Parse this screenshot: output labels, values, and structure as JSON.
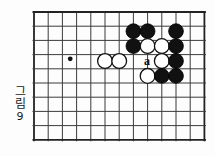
{
  "figure": {
    "caption_text": "그림",
    "caption_number": "9",
    "type": "go-board-diagram"
  },
  "board": {
    "origin_x": 34,
    "origin_y": 12,
    "cell": 14.2,
    "cols": 12,
    "rows": 9,
    "line_color": "#3b3b3b",
    "edge_color": "#222222",
    "line_width": 1.0,
    "edge_width": 1.8,
    "background": "#ffffff"
  },
  "star_points": [
    {
      "name": "star-point-1",
      "col": 2.55,
      "row": 3.3
    }
  ],
  "stones": [
    {
      "name": "stone-black-1",
      "color": "black",
      "col": 7.0,
      "row": 1.35,
      "label": ""
    },
    {
      "name": "stone-black-2",
      "color": "black",
      "col": 8.0,
      "row": 1.35,
      "label": ""
    },
    {
      "name": "stone-black-3",
      "color": "black",
      "col": 10.0,
      "row": 1.35,
      "label": ""
    },
    {
      "name": "stone-black-4",
      "color": "black",
      "col": 7.0,
      "row": 2.4,
      "label": ""
    },
    {
      "name": "stone-white-1",
      "color": "white",
      "col": 8.0,
      "row": 2.4,
      "label": ""
    },
    {
      "name": "stone-white-2",
      "color": "white",
      "col": 9.0,
      "row": 2.4,
      "label": ""
    },
    {
      "name": "stone-black-5",
      "color": "black",
      "col": 10.0,
      "row": 2.4,
      "label": ""
    },
    {
      "name": "stone-white-3",
      "color": "white",
      "col": 5.0,
      "row": 3.45,
      "label": ""
    },
    {
      "name": "stone-white-4",
      "color": "white",
      "col": 6.0,
      "row": 3.45,
      "label": ""
    },
    {
      "name": "stone-white-5",
      "color": "white",
      "col": 9.0,
      "row": 3.45,
      "label": ""
    },
    {
      "name": "stone-black-6",
      "color": "black",
      "col": 10.0,
      "row": 3.45,
      "label": ""
    },
    {
      "name": "stone-white-6",
      "color": "white",
      "col": 8.0,
      "row": 4.5,
      "label": ""
    },
    {
      "name": "stone-black-7",
      "color": "black",
      "col": 9.0,
      "row": 4.5,
      "label": ""
    },
    {
      "name": "stone-black-8",
      "color": "black",
      "col": 10.0,
      "row": 4.5,
      "label": ""
    }
  ],
  "markers": [
    {
      "name": "marker-point-a",
      "label": "a",
      "col": 7.95,
      "row": 3.45
    }
  ],
  "colors": {
    "black_stone_fill": "#111111",
    "black_stone_stroke": "#000000",
    "white_stone_fill": "#ffffff",
    "white_stone_stroke": "#111111",
    "star_point": "#111111",
    "text": "#1a1a1a"
  }
}
